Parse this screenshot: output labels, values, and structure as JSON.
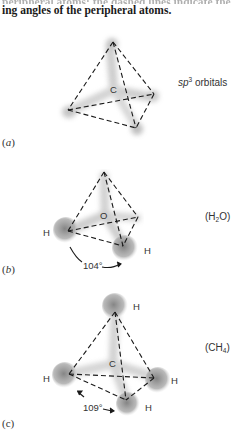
{
  "caption": {
    "text_line1": "peripheral atoms; the dashed lines indicate the bond-",
    "text_line2": "ing angles of the peripheral atoms."
  },
  "panels": [
    {
      "id": "a",
      "letter": "a",
      "central_atom": "C",
      "side_label_prefix": "sp",
      "side_label_sup": "3",
      "side_label_suffix": " orbitals",
      "peripheral_labels": []
    },
    {
      "id": "b",
      "letter": "b",
      "central_atom": "O",
      "formula_open": "(H",
      "formula_sub": "2",
      "formula_close": "O)",
      "peripheral_labels": [
        "H",
        "H"
      ],
      "angle": "104°"
    },
    {
      "id": "c",
      "letter": "c",
      "central_atom": "C",
      "formula_open": "(CH",
      "formula_sub": "4",
      "formula_close": ")",
      "peripheral_labels": [
        "H",
        "H",
        "H",
        "H"
      ],
      "angle": "109°"
    }
  ],
  "colors": {
    "orbital_lobe": "#bdbdbd",
    "orbital_lobe_dark": "#8f8f8f",
    "dashed_line": "#1a1a1a",
    "text": "#333333"
  }
}
